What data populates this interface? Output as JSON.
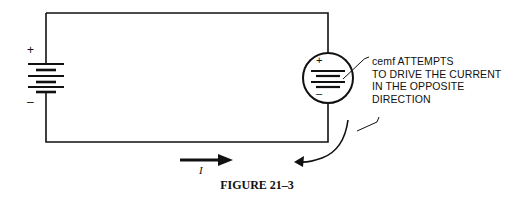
{
  "figure": {
    "caption": "FIGURE 21–3",
    "current_label": "I",
    "battery": {
      "plus": "+",
      "minus": "–"
    },
    "cemf_source": {
      "plus": "+",
      "minus": "–"
    },
    "annotation": {
      "lines": [
        "cemf ATTEMPTS",
        "TO DRIVE THE CURRENT",
        "IN THE OPPOSITE",
        "DIRECTION"
      ]
    },
    "colors": {
      "line": "#111111",
      "background": "#ffffff"
    }
  }
}
